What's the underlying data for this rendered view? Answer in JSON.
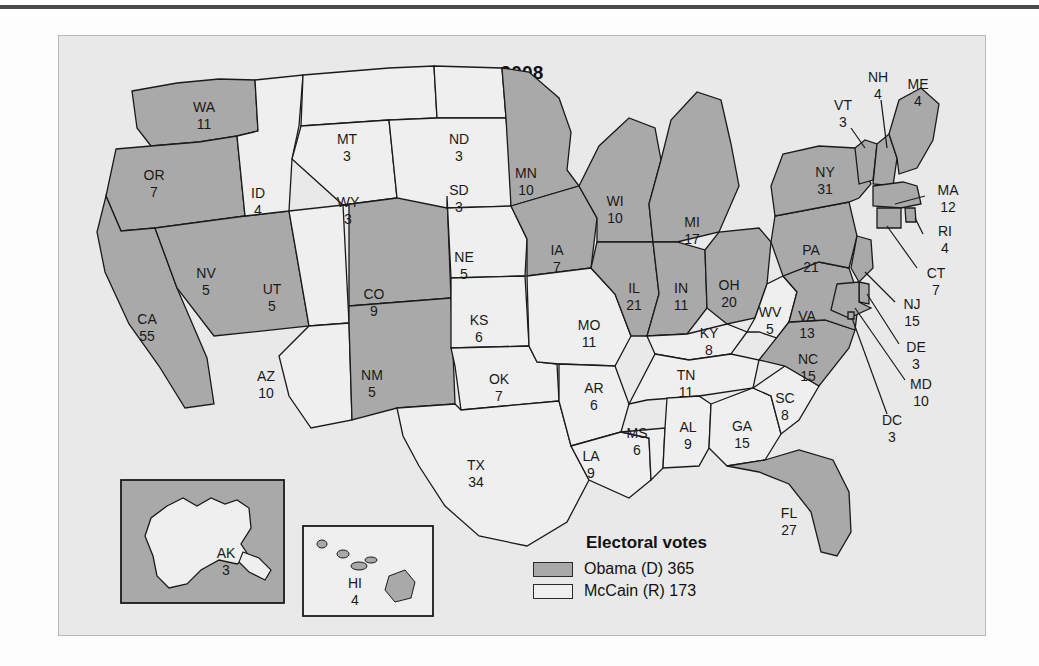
{
  "map": {
    "title": "2008",
    "colors": {
      "obama_fill": "#a9a9a9",
      "mccain_fill": "#efefef",
      "outline": "#1a1a1a",
      "panel_bg": "#e9e9e9",
      "page_bg": "#fdfdfd",
      "rule": "#4a4a4a"
    },
    "legend": {
      "title": "Electoral votes",
      "entries": [
        {
          "label": "Obama (D) 365",
          "swatch": "obama",
          "candidate": "Obama",
          "party": "D",
          "votes": 365
        },
        {
          "label": "McCain (R) 173",
          "swatch": "mccain",
          "candidate": "McCain",
          "party": "R",
          "votes": 173
        }
      ]
    },
    "insets": [
      {
        "name": "alaska-inset",
        "state": "AK",
        "votes": 3,
        "winner": "mccain",
        "box_fill": "obama"
      },
      {
        "name": "hawaii-inset",
        "state": "HI",
        "votes": 4,
        "winner": "obama",
        "box_fill": "mccain"
      }
    ],
    "states": [
      {
        "code": "WA",
        "votes": 11,
        "winner": "obama",
        "lx": 145,
        "ly": 72
      },
      {
        "code": "OR",
        "votes": 7,
        "winner": "obama",
        "lx": 95,
        "ly": 140
      },
      {
        "code": "CA",
        "votes": 55,
        "winner": "obama",
        "lx": 88,
        "ly": 284
      },
      {
        "code": "NV",
        "votes": 5,
        "winner": "obama",
        "lx": 147,
        "ly": 238
      },
      {
        "code": "ID",
        "votes": 4,
        "winner": "mccain",
        "lx": 199,
        "ly": 158
      },
      {
        "code": "UT",
        "votes": 5,
        "winner": "mccain",
        "lx": 213,
        "ly": 254
      },
      {
        "code": "AZ",
        "votes": 10,
        "winner": "mccain",
        "lx": 207,
        "ly": 341
      },
      {
        "code": "MT",
        "votes": 3,
        "winner": "mccain",
        "lx": 288,
        "ly": 104
      },
      {
        "code": "WY",
        "votes": 3,
        "winner": "mccain",
        "lx": 289,
        "ly": 167
      },
      {
        "code": "CO",
        "votes": 9,
        "winner": "obama",
        "lx": 315,
        "ly": 259
      },
      {
        "code": "NM",
        "votes": 5,
        "winner": "obama",
        "lx": 313,
        "ly": 340
      },
      {
        "code": "ND",
        "votes": 3,
        "winner": "mccain",
        "lx": 400,
        "ly": 104
      },
      {
        "code": "SD",
        "votes": 3,
        "winner": "mccain",
        "lx": 400,
        "ly": 155
      },
      {
        "code": "NE",
        "votes": 5,
        "winner": "mccain",
        "lx": 405,
        "ly": 222
      },
      {
        "code": "KS",
        "votes": 6,
        "winner": "mccain",
        "lx": 420,
        "ly": 285
      },
      {
        "code": "OK",
        "votes": 7,
        "winner": "mccain",
        "lx": 440,
        "ly": 344
      },
      {
        "code": "TX",
        "votes": 34,
        "winner": "mccain",
        "lx": 417,
        "ly": 430
      },
      {
        "code": "MN",
        "votes": 10,
        "winner": "obama",
        "lx": 467,
        "ly": 138
      },
      {
        "code": "IA",
        "votes": 7,
        "winner": "obama",
        "lx": 498,
        "ly": 215
      },
      {
        "code": "MO",
        "votes": 11,
        "winner": "mccain",
        "lx": 530,
        "ly": 290
      },
      {
        "code": "AR",
        "votes": 6,
        "winner": "mccain",
        "lx": 535,
        "ly": 353
      },
      {
        "code": "LA",
        "votes": 9,
        "winner": "mccain",
        "lx": 532,
        "ly": 421
      },
      {
        "code": "WI",
        "votes": 10,
        "winner": "obama",
        "lx": 556,
        "ly": 166
      },
      {
        "code": "IL",
        "votes": 21,
        "winner": "obama",
        "lx": 575,
        "ly": 253
      },
      {
        "code": "MS",
        "votes": 6,
        "winner": "mccain",
        "lx": 578,
        "ly": 398
      },
      {
        "code": "MI",
        "votes": 17,
        "winner": "obama",
        "lx": 633,
        "ly": 187
      },
      {
        "code": "IN",
        "votes": 11,
        "winner": "obama",
        "lx": 622,
        "ly": 253
      },
      {
        "code": "KY",
        "votes": 8,
        "winner": "mccain",
        "lx": 650,
        "ly": 298
      },
      {
        "code": "TN",
        "votes": 11,
        "winner": "mccain",
        "lx": 627,
        "ly": 340
      },
      {
        "code": "AL",
        "votes": 9,
        "winner": "mccain",
        "lx": 629,
        "ly": 392
      },
      {
        "code": "OH",
        "votes": 20,
        "winner": "obama",
        "lx": 670,
        "ly": 250
      },
      {
        "code": "WV",
        "votes": 5,
        "winner": "mccain",
        "lx": 711,
        "ly": 277
      },
      {
        "code": "GA",
        "votes": 15,
        "winner": "mccain",
        "lx": 683,
        "ly": 391
      },
      {
        "code": "SC",
        "votes": 8,
        "winner": "mccain",
        "lx": 726,
        "ly": 363
      },
      {
        "code": "NC",
        "votes": 15,
        "winner": "obama",
        "lx": 749,
        "ly": 324
      },
      {
        "code": "VA",
        "votes": 13,
        "winner": "obama",
        "lx": 748,
        "ly": 281
      },
      {
        "code": "PA",
        "votes": 21,
        "winner": "obama",
        "lx": 752,
        "ly": 215
      },
      {
        "code": "NY",
        "votes": 31,
        "winner": "obama",
        "lx": 766,
        "ly": 137
      },
      {
        "code": "FL",
        "votes": 27,
        "winner": "obama",
        "lx": 730,
        "ly": 478
      }
    ],
    "callouts": [
      {
        "code": "VT",
        "votes": 3,
        "winner": "obama",
        "lx": 784,
        "ly": 70,
        "line": [
          [
            792,
            92
          ],
          [
            805,
            110
          ]
        ]
      },
      {
        "code": "NH",
        "votes": 4,
        "winner": "obama",
        "lx": 819,
        "ly": 42,
        "line": [
          [
            822,
            64
          ],
          [
            827,
            104
          ]
        ]
      },
      {
        "code": "ME",
        "votes": 4,
        "winner": "obama",
        "lx": 859,
        "ly": 49,
        "line": null
      },
      {
        "code": "MA",
        "votes": 12,
        "winner": "obama",
        "lx": 889,
        "ly": 155,
        "line": [
          [
            866,
            163
          ],
          [
            832,
            173
          ]
        ]
      },
      {
        "code": "RI",
        "votes": 4,
        "winner": "obama",
        "lx": 886,
        "ly": 196,
        "line": [
          [
            866,
            200
          ],
          [
            827,
            186
          ]
        ]
      },
      {
        "code": "CT",
        "votes": 7,
        "winner": "obama",
        "lx": 877,
        "ly": 238,
        "line": [
          [
            860,
            232
          ],
          [
            820,
            192
          ]
        ]
      },
      {
        "code": "NJ",
        "votes": 15,
        "winner": "obama",
        "lx": 853,
        "ly": 269,
        "line": [
          [
            836,
            265
          ],
          [
            805,
            240
          ]
        ]
      },
      {
        "code": "DE",
        "votes": 3,
        "winner": "obama",
        "lx": 857,
        "ly": 312,
        "line": [
          [
            840,
            308
          ],
          [
            806,
            272
          ]
        ]
      },
      {
        "code": "MD",
        "votes": 10,
        "winner": "obama",
        "lx": 862,
        "ly": 349,
        "line": [
          [
            846,
            344
          ],
          [
            802,
            283
          ]
        ]
      },
      {
        "code": "DC",
        "votes": 3,
        "winner": "obama",
        "lx": 833,
        "ly": 385,
        "line": [
          [
            828,
            376
          ],
          [
            795,
            290
          ]
        ]
      }
    ]
  }
}
